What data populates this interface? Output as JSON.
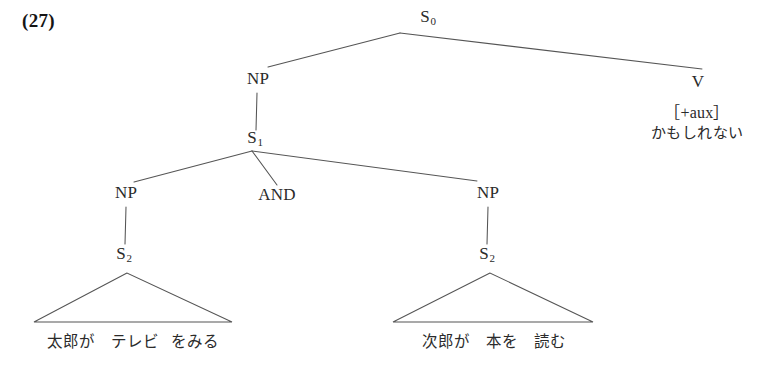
{
  "figure": {
    "example_number": "(27)"
  },
  "nodes": {
    "s0": {
      "label": "S",
      "subscript": "0"
    },
    "np_top": {
      "label": "NP"
    },
    "v": {
      "label": "V"
    },
    "s1": {
      "label": "S",
      "subscript": "1"
    },
    "np_left": {
      "label": "NP"
    },
    "conj": {
      "label": "AND"
    },
    "np_right": {
      "label": "NP"
    },
    "s2_left": {
      "label": "S",
      "subscript": "2"
    },
    "s2_right": {
      "label": "S",
      "subscript": "2"
    }
  },
  "v_node": {
    "feature": "［+aux］",
    "word": "かもしれない"
  },
  "terminals": {
    "left": {
      "segments": [
        "太郎が",
        "テレビ",
        "をみる"
      ],
      "full": "太郎が テレビ をみる"
    },
    "right": {
      "segments": [
        "次郎が",
        "本を",
        "読む"
      ],
      "full": "次郎が 本を 読む"
    }
  },
  "colors": {
    "ink": "#2a2a2a",
    "line": "#4a4a4a",
    "background": "#ffffff"
  }
}
